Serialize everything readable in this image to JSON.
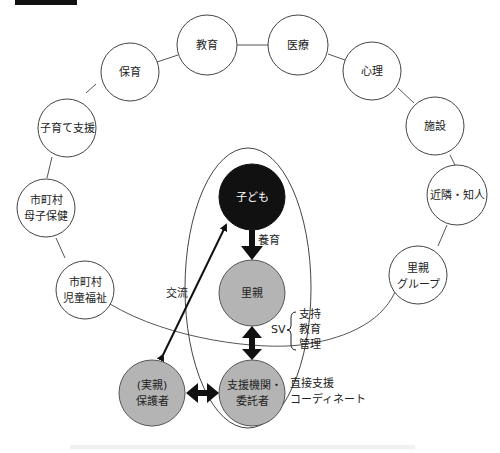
{
  "header": {
    "figure_tag_color": "#111111",
    "figure_caption_faded": ""
  },
  "outer_ring": {
    "nodes": [
      {
        "id": "kyoiku",
        "lines": [
          "教育"
        ]
      },
      {
        "id": "iryo",
        "lines": [
          "医療"
        ]
      },
      {
        "id": "shinri",
        "lines": [
          "心理"
        ]
      },
      {
        "id": "shisetsu",
        "lines": [
          "施設"
        ]
      },
      {
        "id": "kinrin",
        "lines": [
          "近隣・知人"
        ]
      },
      {
        "id": "satooya-group",
        "lines": [
          "里親",
          "グループ"
        ]
      },
      {
        "id": "hoiku",
        "lines": [
          "保育"
        ]
      },
      {
        "id": "kosodate",
        "lines": [
          "子育て支援"
        ]
      },
      {
        "id": "boshi",
        "lines": [
          "市町村",
          "母子保健"
        ]
      },
      {
        "id": "jido",
        "lines": [
          "市町村",
          "児童福祉"
        ]
      }
    ]
  },
  "core": {
    "child": {
      "label": "子ども",
      "fill": "#111111"
    },
    "foster_parent": {
      "label": "里親",
      "fill": "#b4b4b4"
    },
    "agency": {
      "lines": [
        "支援機関・",
        "委託者"
      ],
      "fill": "#b4b4b4"
    },
    "guardian": {
      "lines": [
        "(実親)",
        "保護者"
      ],
      "fill": "#b4b4b4"
    }
  },
  "edges": {
    "nurture": "養育",
    "exchange": "交流",
    "sv": "SV",
    "sv_items": [
      "支持",
      "教育",
      "管理"
    ],
    "direct_support": [
      "直接支援",
      "コーディネート"
    ]
  },
  "footer": {
    "caption_faded": ""
  }
}
